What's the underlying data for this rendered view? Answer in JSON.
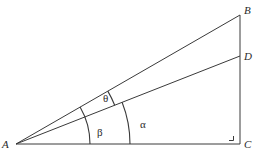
{
  "diagram": {
    "points": {
      "A": {
        "label": "A",
        "x": 16,
        "y": 144
      },
      "B": {
        "label": "B",
        "x": 240,
        "y": 15
      },
      "C": {
        "label": "C",
        "x": 240,
        "y": 144
      },
      "D": {
        "label": "D",
        "x": 240,
        "y": 56
      }
    },
    "segments": [
      "AB",
      "AD",
      "AC",
      "BC"
    ],
    "right_angle_at": "C",
    "angles": {
      "theta": {
        "label": "θ",
        "between": [
          "AB",
          "AD"
        ]
      },
      "beta": {
        "label": "β",
        "between": [
          "AB",
          "AC"
        ]
      },
      "alpha": {
        "label": "α",
        "between": [
          "AD",
          "AC"
        ]
      }
    },
    "colors": {
      "stroke": "#3a3a3a",
      "text": "#2a2a2a",
      "background": "#ffffff"
    }
  }
}
